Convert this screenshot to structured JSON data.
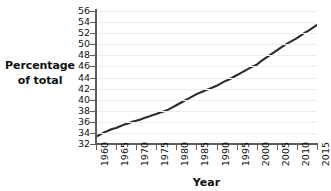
{
  "chart_data": {
    "type": "line",
    "title": "",
    "xlabel": "Year",
    "ylabel": "Percentage of total",
    "ylabel_lines": [
      "Percentage",
      "of total"
    ],
    "xlim": [
      1960,
      2015
    ],
    "ylim": [
      32,
      56
    ],
    "grid": true,
    "legend": false,
    "yticks": [
      32,
      34,
      36,
      38,
      40,
      42,
      44,
      46,
      48,
      50,
      52,
      54,
      56
    ],
    "ytick_labels": [
      "32",
      "34",
      "36",
      "38",
      "40",
      "42",
      "44",
      "46",
      "48",
      "50",
      "52",
      "54",
      "56"
    ],
    "xticks": [
      1960,
      1965,
      1970,
      1975,
      1980,
      1985,
      1990,
      1995,
      2000,
      2005,
      2010,
      2015
    ],
    "xtick_labels": [
      "1960",
      "1965",
      "1970",
      "1975",
      "1980",
      "1985",
      "1990",
      "1995",
      "2000",
      "2005",
      "2010",
      "2015"
    ],
    "series": [
      {
        "name": "Percentage of total",
        "color": "#2b2b2b",
        "x": [
          1960,
          1961,
          1962,
          1963,
          1964,
          1965,
          1966,
          1967,
          1968,
          1969,
          1970,
          1971,
          1972,
          1973,
          1974,
          1975,
          1976,
          1977,
          1978,
          1979,
          1980,
          1981,
          1982,
          1983,
          1984,
          1985,
          1986,
          1987,
          1988,
          1989,
          1990,
          1991,
          1992,
          1993,
          1994,
          1995,
          1996,
          1997,
          1998,
          1999,
          2000,
          2001,
          2002,
          2003,
          2004,
          2005,
          2006,
          2007,
          2008,
          2009,
          2010,
          2011,
          2012,
          2013,
          2014,
          2015
        ],
        "y": [
          33.3,
          33.7,
          34.1,
          34.4,
          34.7,
          34.9,
          35.2,
          35.5,
          35.7,
          36.0,
          36.2,
          36.4,
          36.7,
          36.9,
          37.2,
          37.4,
          37.7,
          37.9,
          38.2,
          38.6,
          39.0,
          39.4,
          39.8,
          40.2,
          40.6,
          41.0,
          41.3,
          41.6,
          41.9,
          42.2,
          42.5,
          42.9,
          43.3,
          43.6,
          44.0,
          44.4,
          44.8,
          45.2,
          45.6,
          46.0,
          46.3,
          46.9,
          47.4,
          47.9,
          48.4,
          48.9,
          49.4,
          49.9,
          50.3,
          50.7,
          51.1,
          51.6,
          52.1,
          52.5,
          53.0,
          53.5
        ]
      }
    ]
  },
  "axes": {
    "y_title": "Percentage of total",
    "x_title": "Year"
  }
}
